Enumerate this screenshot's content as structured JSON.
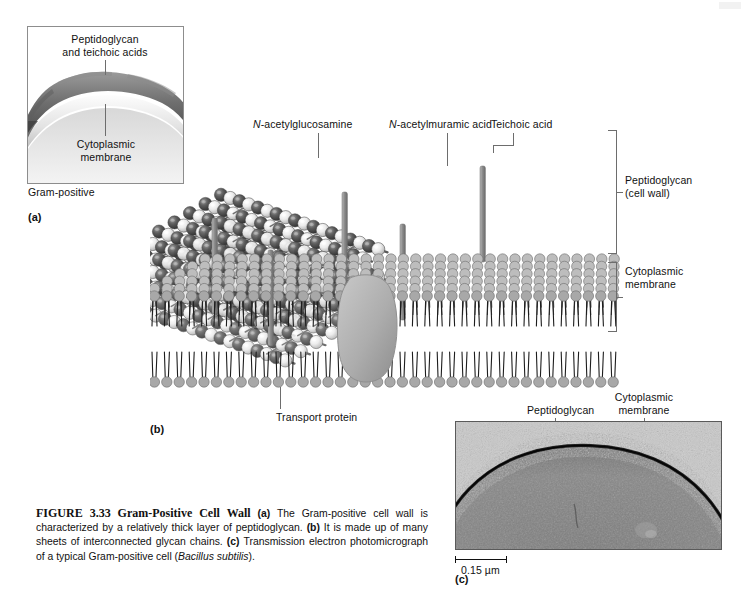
{
  "figure": {
    "number": "FIGURE 3.33",
    "title": "Gram-Positive Cell Wall",
    "caption_a_tag": "(a)",
    "caption_a_text": "The Gram-positive cell wall is characterized by a relatively thick layer of peptidoglycan.",
    "caption_b_tag": "(b)",
    "caption_b_text": "It is made up of many sheets of interconnected glycan chains.",
    "caption_c_tag": "(c)",
    "caption_c_text": "Transmission electron photomicrograph of a typical Gram-positive cell (",
    "caption_c_species": "Bacillus subtilis",
    "caption_c_tail": ")."
  },
  "panel_a": {
    "tag": "(a)",
    "sublabel": "Gram-positive",
    "label_peptidoglycan_line1": "Peptidoglycan",
    "label_peptidoglycan_line2": "and teichoic acids",
    "label_membrane_line1": "Cytoplasmic",
    "label_membrane_line2": "membrane"
  },
  "panel_b": {
    "tag": "(b)",
    "label_nag": "N-acetylglucosamine",
    "label_nag_italic": "N",
    "label_nag_rest": "-acetylglucosamine",
    "label_nam_italic": "N",
    "label_nam_rest": "-acetylmuramic acid",
    "label_teichoic": "Teichoic acid",
    "label_transport": "Transport protein",
    "bracket_peptidoglycan_line1": "Peptidoglycan",
    "bracket_peptidoglycan_line2": "(cell wall)",
    "bracket_membrane_line1": "Cytoplasmic",
    "bracket_membrane_line2": "membrane"
  },
  "panel_c": {
    "tag": "(c)",
    "label_peptidoglycan": "Peptidoglycan",
    "label_membrane_line1": "Cytoplasmic",
    "label_membrane_line2": "membrane",
    "scale_bar_value": "0.15 µm"
  },
  "colors": {
    "nag_sphere": "#555555",
    "nam_sphere": "#e8e8e8",
    "teichoic_rod": "#9a9a9a",
    "membrane_head": "#a8a8a8",
    "transport_protein": "#b3b3b3",
    "leader_line": "#6d6d6d",
    "panel_border": "#8d8d8d",
    "text": "#111111",
    "micrograph_background": "#8a8a8a"
  }
}
